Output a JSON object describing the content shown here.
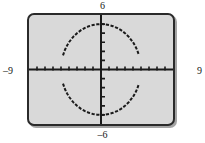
{
  "figure": {
    "kind": "graphing-calculator-screen",
    "screen_background": "#d9d9d9",
    "frame_color": "#2a2a2a",
    "ink_color": "#1a1a1a"
  },
  "labels": {
    "top": "6",
    "bottom": "–6",
    "left": "–9",
    "right": "9"
  },
  "chart_data": {
    "type": "line",
    "title": "",
    "subtitle": "",
    "xlabel": "",
    "ylabel": "",
    "xlim": [
      -9,
      9
    ],
    "ylim": [
      -6,
      6
    ],
    "xtick_labels": [
      "–9",
      "9"
    ],
    "ytick_labels": [
      "6",
      "–6"
    ],
    "xscl": 1,
    "yscl": 1,
    "grid": false,
    "legend": "none",
    "axes": {
      "x_axis_y": 0,
      "y_axis_x": 0,
      "tick_marks": true,
      "x_ticks": [
        -8,
        -7,
        -6,
        -5,
        -4,
        -3,
        -2,
        -1,
        1,
        2,
        3,
        4,
        5,
        6,
        7,
        8
      ],
      "y_ticks": [
        -5,
        -4,
        -3,
        -2,
        -1,
        1,
        2,
        3,
        4,
        5
      ]
    },
    "annotations": [],
    "series": [
      {
        "name": "upper semicircle",
        "expression": "y = sqrt(25 - x^2)",
        "style": "dashed",
        "color": "#1a1a1a",
        "x_range": [
          -5,
          5
        ],
        "points": [
          [
            -4.75,
            1.56
          ],
          [
            -4.5,
            2.18
          ],
          [
            -4.25,
            2.63
          ],
          [
            -4.0,
            3.0
          ],
          [
            -3.5,
            3.57
          ],
          [
            -3.0,
            4.0
          ],
          [
            -2.5,
            4.33
          ],
          [
            -2.0,
            4.58
          ],
          [
            -1.5,
            4.77
          ],
          [
            -1.0,
            4.9
          ],
          [
            -0.5,
            4.97
          ],
          [
            0,
            5.0
          ],
          [
            0.5,
            4.97
          ],
          [
            1.0,
            4.9
          ],
          [
            1.5,
            4.77
          ],
          [
            2.0,
            4.58
          ],
          [
            2.5,
            4.33
          ],
          [
            3.0,
            4.0
          ],
          [
            3.5,
            3.57
          ],
          [
            4.0,
            3.0
          ],
          [
            4.25,
            2.63
          ],
          [
            4.5,
            2.18
          ],
          [
            4.75,
            1.56
          ]
        ]
      },
      {
        "name": "lower semicircle",
        "expression": "y = –sqrt(25 - x^2)",
        "style": "dashed",
        "color": "#1a1a1a",
        "x_range": [
          -5,
          5
        ],
        "points": [
          [
            -4.75,
            -1.56
          ],
          [
            -4.5,
            -2.18
          ],
          [
            -4.25,
            -2.63
          ],
          [
            -4.0,
            -3.0
          ],
          [
            -3.5,
            -3.57
          ],
          [
            -3.0,
            -4.0
          ],
          [
            -2.5,
            -4.33
          ],
          [
            -2.0,
            -4.58
          ],
          [
            -1.5,
            -4.77
          ],
          [
            -1.0,
            -4.9
          ],
          [
            -0.5,
            -4.97
          ],
          [
            0,
            -5.0
          ],
          [
            0.5,
            -4.97
          ],
          [
            1.0,
            -4.9
          ],
          [
            1.5,
            -4.77
          ],
          [
            2.0,
            -4.58
          ],
          [
            2.5,
            -4.33
          ],
          [
            3.0,
            -4.0
          ],
          [
            3.5,
            -3.57
          ],
          [
            4.0,
            -3.0
          ],
          [
            4.25,
            -2.63
          ],
          [
            4.5,
            -2.18
          ],
          [
            4.75,
            -1.56
          ]
        ]
      }
    ]
  }
}
